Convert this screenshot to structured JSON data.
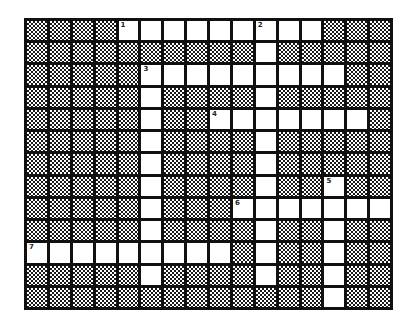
{
  "puzzle": {
    "rows": 13,
    "cols": 16,
    "layout": [
      "BBBBOOOOOOOOOBBB",
      "BBBBBBBBBBOBBBBB",
      "BBBBBOOOOOOOOOBB",
      "BBBBBOBBBBOBBBBB",
      "BBBBBOBBOOOOOOOB",
      "BBBBBOBBBBOBBBBB",
      "BBBBBOBBBBOBBBBB",
      "BBBBBOBBBBOBBOBB",
      "BBBBBOBBBOOOOOOO",
      "BBBBBOBBBBOBBOBB",
      "OOOOOOOOOBOBBOBB",
      "BBBBBOBBBBOBBOBB",
      "BBBBBBBBBBBBBOBB"
    ],
    "numbers": [
      {
        "row": 0,
        "col": 4,
        "label": "1"
      },
      {
        "row": 0,
        "col": 10,
        "label": "2"
      },
      {
        "row": 2,
        "col": 5,
        "label": "3"
      },
      {
        "row": 4,
        "col": 8,
        "label": "4"
      },
      {
        "row": 7,
        "col": 13,
        "label": "5"
      },
      {
        "row": 8,
        "col": 9,
        "label": "6"
      },
      {
        "row": 10,
        "col": 0,
        "label": "7"
      }
    ]
  },
  "colors": {
    "grid_line": "#111111",
    "open_cell": "#ffffff",
    "block_pattern": "#1a1a1a"
  }
}
